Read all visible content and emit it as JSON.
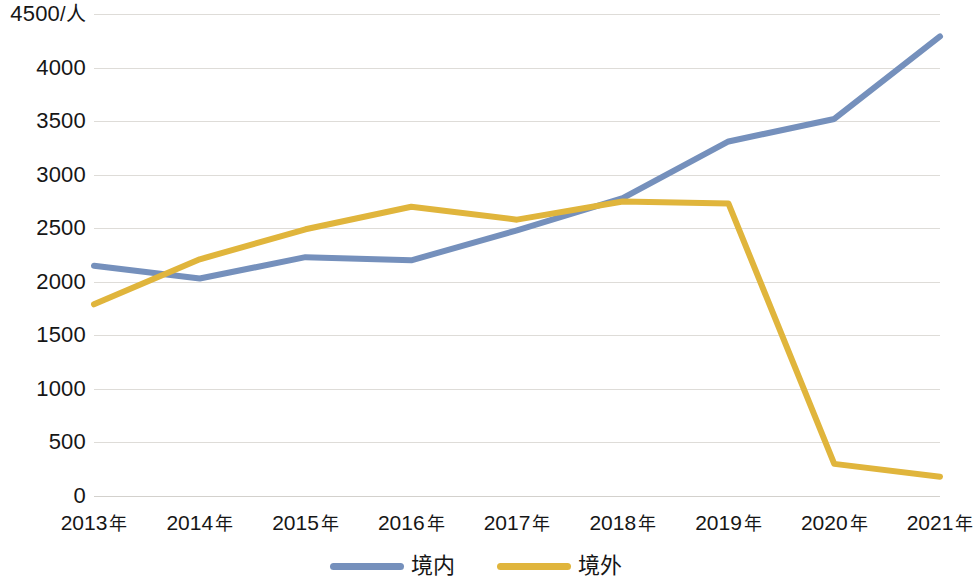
{
  "chart_data": {
    "type": "line",
    "title": "",
    "subtitle": "",
    "xlabel": "",
    "ylabel": "/人",
    "categories": [
      "2013 年",
      "2014 年",
      "2015 年",
      "2016 年",
      "2017 年",
      "2018 年",
      "2019 年",
      "2020 年",
      "2021 年"
    ],
    "x_values": [
      2013,
      2014,
      2015,
      2016,
      2017,
      2018,
      2019,
      2020,
      2021
    ],
    "series": [
      {
        "name": "境内",
        "color": "#7590bc",
        "values": [
          2150,
          2030,
          2230,
          2200,
          2480,
          2780,
          3310,
          3520,
          4290
        ]
      },
      {
        "name": "境外",
        "color": "#e0b53c",
        "values": [
          1790,
          2210,
          2490,
          2700,
          2580,
          2750,
          2730,
          300,
          180
        ]
      }
    ],
    "ylim": [
      0,
      4500
    ],
    "y_ticks": [
      0,
      500,
      1000,
      1500,
      2000,
      2500,
      3000,
      3500,
      4000,
      4500
    ],
    "y_tick_labels": [
      "0",
      "500",
      "1000",
      "1500",
      "2000",
      "2500",
      "3000",
      "3500",
      "4000",
      "4500"
    ],
    "y_axis_unit_label": "4500/人",
    "grid": true,
    "grid_axis": "y",
    "legend_position": "bottom"
  },
  "legend": {
    "items": [
      {
        "label": "境内",
        "color": "#7590bc"
      },
      {
        "label": "境外",
        "color": "#e0b53c"
      }
    ]
  }
}
